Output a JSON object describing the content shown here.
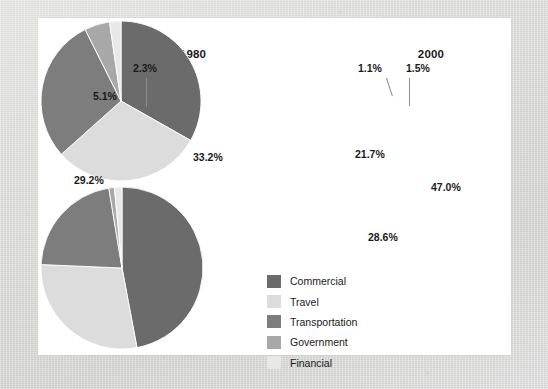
{
  "chart_data": [
    {
      "type": "pie",
      "title": "1980",
      "categories": [
        "Commercial",
        "Travel",
        "Transportation",
        "Government",
        "Financial"
      ],
      "values": [
        33.2,
        30.2,
        29.2,
        5.1,
        2.3
      ],
      "labels": [
        "33.2%",
        "30.2%",
        "29.2%",
        "5.1%",
        "2.3%"
      ],
      "colors": [
        "#6b6b6b",
        "#dcdcdc",
        "#7d7d7d",
        "#a8a8a8",
        "#e8e8e8"
      ],
      "start_angle_deg": 0,
      "direction": "clockwise",
      "legend_position": "center-bottom",
      "grid": false,
      "xlabel": "",
      "ylabel": ""
    },
    {
      "type": "pie",
      "title": "2000",
      "categories": [
        "Commercial",
        "Travel",
        "Transportation",
        "Government",
        "Financial"
      ],
      "values": [
        47.0,
        28.6,
        21.7,
        1.1,
        1.5
      ],
      "labels": [
        "47.0%",
        "28.6%",
        "21.7%",
        "1.1%",
        "1.5%"
      ],
      "colors": [
        "#6b6b6b",
        "#dcdcdc",
        "#7d7d7d",
        "#a8a8a8",
        "#e8e8e8"
      ],
      "start_angle_deg": 0,
      "direction": "clockwise",
      "legend_position": "center-bottom",
      "grid": false,
      "xlabel": "",
      "ylabel": ""
    }
  ],
  "charts": {
    "left": {
      "title": "1980",
      "slice_labels": {
        "commercial": "33.2%",
        "travel": "30.2%",
        "transportation": "29.2%",
        "government": "5.1%",
        "financial": "2.3%"
      }
    },
    "right": {
      "title": "2000",
      "slice_labels": {
        "commercial": "47.0%",
        "travel": "28.6%",
        "transportation": "21.7%",
        "government": "1.1%",
        "financial": "1.5%"
      }
    }
  },
  "legend": {
    "items": [
      {
        "label": "Commercial",
        "color": "#6b6b6b"
      },
      {
        "label": "Travel",
        "color": "#dcdcdc"
      },
      {
        "label": "Transportation",
        "color": "#7d7d7d"
      },
      {
        "label": "Government",
        "color": "#a8a8a8"
      },
      {
        "label": "Financial",
        "color": "#e8e8e8"
      }
    ]
  }
}
